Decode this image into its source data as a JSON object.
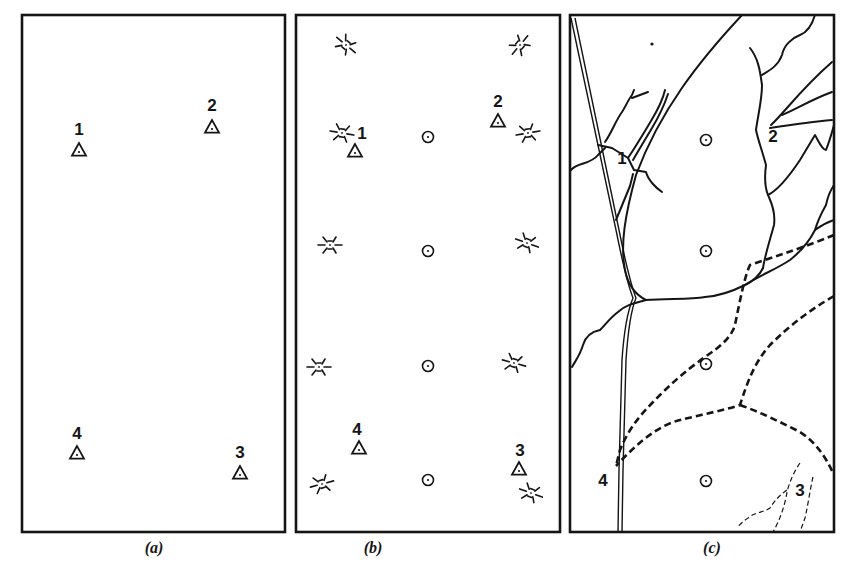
{
  "figure": {
    "panels": [
      {
        "id": "a",
        "caption": "(a)",
        "frame": {
          "x": 22,
          "y": 15,
          "w": 263,
          "h": 517
        },
        "triangles": [
          {
            "label": "1",
            "x": 79,
            "y": 150,
            "lx": 79,
            "ly": 135
          },
          {
            "label": "2",
            "x": 212,
            "y": 127,
            "lx": 212,
            "ly": 111
          },
          {
            "label": "4",
            "x": 77,
            "y": 453,
            "lx": 77,
            "ly": 439
          },
          {
            "label": "3",
            "x": 240,
            "y": 473,
            "lx": 240,
            "ly": 458
          }
        ],
        "circles": [],
        "stars": []
      },
      {
        "id": "b",
        "caption": "(b)",
        "frame": {
          "x": 296,
          "y": 15,
          "w": 264,
          "h": 517
        },
        "triangles": [
          {
            "label": "1",
            "x": 355,
            "y": 151,
            "lx": 362,
            "ly": 139
          },
          {
            "label": "2",
            "x": 498,
            "y": 121,
            "lx": 498,
            "ly": 107
          },
          {
            "label": "4",
            "x": 359,
            "y": 448,
            "lx": 357,
            "ly": 435
          },
          {
            "label": "3",
            "x": 519,
            "y": 469,
            "lx": 520,
            "ly": 456
          }
        ],
        "circles": [
          {
            "x": 428,
            "y": 137
          },
          {
            "x": 428,
            "y": 251
          },
          {
            "x": 428,
            "y": 366
          },
          {
            "x": 428,
            "y": 480
          }
        ],
        "stars": [
          {
            "x": 346,
            "y": 45,
            "rot": 40
          },
          {
            "x": 520,
            "y": 45,
            "rot": -50
          },
          {
            "x": 342,
            "y": 133,
            "rot": 10
          },
          {
            "x": 528,
            "y": 133,
            "rot": -10
          },
          {
            "x": 330,
            "y": 245,
            "rot": 0
          },
          {
            "x": 527,
            "y": 243,
            "rot": 20
          },
          {
            "x": 319,
            "y": 367,
            "rot": 0
          },
          {
            "x": 514,
            "y": 363,
            "rot": 15
          },
          {
            "x": 322,
            "y": 484,
            "rot": -15
          },
          {
            "x": 531,
            "y": 493,
            "rot": 20
          }
        ]
      },
      {
        "id": "c",
        "caption": "(c)",
        "frame": {
          "x": 570,
          "y": 15,
          "w": 264,
          "h": 517
        },
        "triangles": [],
        "circles": [
          {
            "x": 706,
            "y": 140
          },
          {
            "x": 706,
            "y": 251
          },
          {
            "x": 706,
            "y": 364
          },
          {
            "x": 706,
            "y": 481
          }
        ],
        "labels": [
          {
            "text": "1",
            "x": 622,
            "y": 164
          },
          {
            "text": "2",
            "x": 773,
            "y": 142
          },
          {
            "text": "4",
            "x": 603,
            "y": 486
          },
          {
            "text": "3",
            "x": 800,
            "y": 496
          }
        ],
        "dot": {
          "x": 652,
          "y": 44
        }
      }
    ],
    "captions": {
      "a": "(a)",
      "b": "(b)",
      "c": "(c)"
    }
  }
}
